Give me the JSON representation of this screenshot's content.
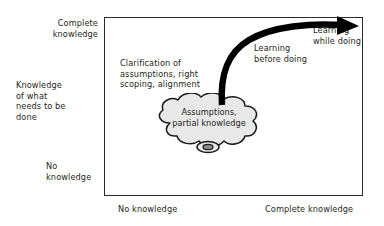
{
  "figure": {
    "axes": {
      "y_top_label": "Complete\nknowledge",
      "y_title": "Knowledge\nof what\nneeds to be\ndone",
      "y_bottom_label": "No\nknowledge",
      "x_left_label": "No knowledge",
      "x_right_label": "Complete knowledge"
    },
    "annotations": {
      "clarification": "Clarification of\nassumptions, right\nscoping, alignment",
      "learning_before_doing": "Learning\nbefore doing",
      "learning_while_doing": "Learning\nwhile doing"
    },
    "cloud": {
      "label": "Assumptions,\npartial knowledge",
      "fill_color": "#e8e8e8",
      "stroke_color": "#1a1a1a"
    },
    "arrow": {
      "name": "growth-arrow",
      "color": "#000000",
      "description": "thick curved arrow rising from cloud to top right"
    },
    "colors": {
      "frame": "#2b2b2b",
      "text": "#231f20",
      "background": "#ffffff"
    }
  }
}
